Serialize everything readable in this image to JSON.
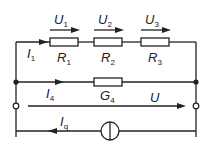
{
  "diagram": {
    "type": "electrical-circuit",
    "colors": {
      "line": "#222222",
      "background": "#ffffff"
    },
    "series_branch": {
      "resistors": [
        {
          "name": "R",
          "sub": "1",
          "voltage": "U",
          "voltage_sub": "1"
        },
        {
          "name": "R",
          "sub": "2",
          "voltage": "U",
          "voltage_sub": "2"
        },
        {
          "name": "R",
          "sub": "3",
          "voltage": "U",
          "voltage_sub": "3"
        }
      ],
      "current": {
        "name": "I",
        "sub": "1"
      }
    },
    "parallel_branch": {
      "conductance": {
        "name": "G",
        "sub": "4"
      },
      "current": {
        "name": "I",
        "sub": "4"
      }
    },
    "terminal_voltage": {
      "name": "U"
    },
    "source": {
      "type": "current-source",
      "current": {
        "name": "I",
        "sub": "q"
      }
    }
  }
}
